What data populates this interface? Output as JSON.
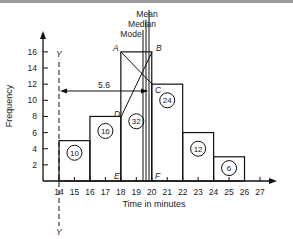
{
  "chart_data": {
    "type": "bar",
    "title": "",
    "xlabel": "Time in minutes",
    "ylabel": "Frequency",
    "x_ticks": [
      "14",
      "15",
      "16",
      "17",
      "18",
      "19",
      "20",
      "21",
      "22",
      "23",
      "24",
      "25",
      "26",
      "27"
    ],
    "y_ticks": [
      "2",
      "4",
      "6",
      "8",
      "10",
      "12",
      "14",
      "16"
    ],
    "xlim": [
      13.0,
      27.5
    ],
    "ylim": [
      0,
      17.5
    ],
    "bins": [
      {
        "from": 14,
        "to": 16,
        "frequency": 5,
        "area_label": "10"
      },
      {
        "from": 16,
        "to": 18,
        "frequency": 8,
        "area_label": "16"
      },
      {
        "from": 18,
        "to": 20,
        "frequency": 16,
        "area_label": "32"
      },
      {
        "from": 20,
        "to": 22,
        "frequency": 12,
        "area_label": "24"
      },
      {
        "from": 22,
        "to": 24,
        "frequency": 6,
        "area_label": "12"
      },
      {
        "from": 24,
        "to": 26,
        "frequency": 3,
        "area_label": "6"
      }
    ],
    "annotations": {
      "vertical_lines": [
        "Mean",
        "Median",
        "Mode"
      ],
      "points": [
        "A",
        "B",
        "C",
        "D",
        "E",
        "F"
      ],
      "dashed_axis_label": "Y",
      "dashed_axis_label_bottom": "Y",
      "horizontal_arrow_value": "5.6",
      "horizontal_arrow_at_frequency": 11.2
    },
    "grid": false,
    "legend": null
  }
}
